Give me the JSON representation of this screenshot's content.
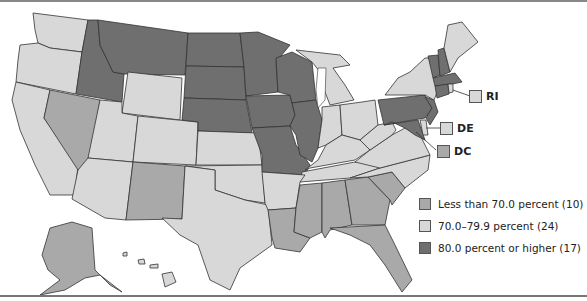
{
  "colors": {
    "low": "#a9a9a9",
    "mid": "#d8d8d8",
    "high": "#6f6f6f",
    "border": "#333333"
  },
  "legend": {
    "items": [
      {
        "label": "Less than 70.0 percent (10)",
        "category": "low"
      },
      {
        "label": "70.0–79.9 percent (24)",
        "category": "mid"
      },
      {
        "label": "80.0 percent or higher (17)",
        "category": "high"
      }
    ]
  },
  "callouts": [
    {
      "label": "RI",
      "category": "mid"
    },
    {
      "label": "DE",
      "category": "mid"
    },
    {
      "label": "DC",
      "category": "low"
    }
  ],
  "map": {
    "type": "choropleth",
    "region": "United States",
    "states": {
      "high": [
        "ID",
        "MT",
        "ND",
        "SD",
        "NE",
        "MN",
        "IA",
        "WI",
        "IL",
        "MO",
        "PA",
        "NJ",
        "MD",
        "NH",
        "VT",
        "MA",
        "CT"
      ],
      "low": [
        "NV",
        "NM",
        "AK",
        "LA",
        "MS",
        "AL",
        "GA",
        "SC",
        "FL",
        "DC"
      ],
      "mid": [
        "WA",
        "OR",
        "CA",
        "WY",
        "UT",
        "CO",
        "AZ",
        "KS",
        "OK",
        "TX",
        "AR",
        "MI",
        "IN",
        "OH",
        "KY",
        "TN",
        "WV",
        "VA",
        "NC",
        "NY",
        "ME",
        "RI",
        "DE",
        "HI"
      ]
    }
  }
}
